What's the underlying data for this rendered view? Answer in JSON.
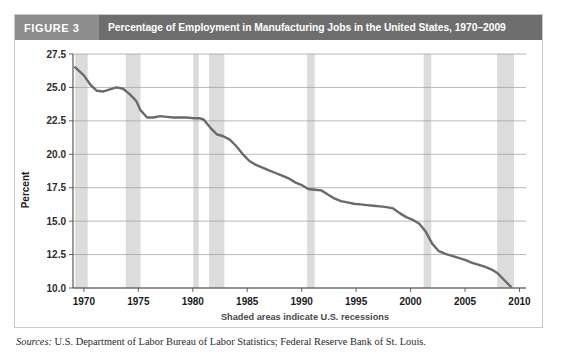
{
  "figure": {
    "tag": "FIGURE 3",
    "title": "Percentage of Employment in Manufacturing Jobs in the United States, 1970–2009",
    "tag_bg": "#8d8d8d",
    "title_bg": "#6e6e6e",
    "panel_border": "#c9c9c9"
  },
  "source": {
    "label": "Sources:",
    "text": " U.S. Department of Labor Bureau of Labor Statistics; Federal Reserve Bank of St. Louis."
  },
  "chart_data": {
    "type": "line",
    "title": "Percentage of Employment in Manufacturing Jobs in the United States, 1970–2009",
    "xlabel": "",
    "ylabel": "Percent",
    "caption": "Shaded areas indicate U.S. recessions",
    "xlim": [
      1969.0,
      2010.6
    ],
    "ylim": [
      10.0,
      27.5
    ],
    "xticks": [
      1970,
      1975,
      1980,
      1985,
      1990,
      1995,
      2000,
      2005,
      2010
    ],
    "xtick_labels": [
      "1970",
      "1975",
      "1980",
      "1985",
      "1990",
      "1995",
      "2000",
      "2005",
      "2010"
    ],
    "yticks": [
      10.0,
      12.5,
      15.0,
      17.5,
      20.0,
      22.5,
      25.0,
      27.5
    ],
    "ytick_labels": [
      "10.0",
      "12.5",
      "15.0",
      "17.5",
      "20.0",
      "22.5",
      "25.0",
      "27.5"
    ],
    "grid": "horizontal",
    "grid_color": "#9a9a9a",
    "line_color": "#6a6a6a",
    "line_width": 2.4,
    "band_color": "#dcdcdc",
    "legend": "none",
    "series": [
      {
        "name": "Manufacturing share of employment",
        "x": [
          1969.2,
          1970.0,
          1970.6,
          1971.2,
          1971.8,
          1972.4,
          1973.0,
          1973.6,
          1974.2,
          1974.8,
          1975.2,
          1975.8,
          1976.4,
          1977.0,
          1977.6,
          1978.2,
          1978.8,
          1979.4,
          1980.0,
          1980.6,
          1981.0,
          1981.6,
          1982.2,
          1982.8,
          1983.4,
          1984.0,
          1984.6,
          1985.2,
          1985.8,
          1986.4,
          1987.0,
          1987.6,
          1988.2,
          1988.8,
          1989.4,
          1990.0,
          1990.6,
          1991.2,
          1991.8,
          1992.4,
          1993.0,
          1993.6,
          1994.2,
          1994.8,
          1995.4,
          1996.0,
          1996.6,
          1997.2,
          1997.8,
          1998.4,
          1999.0,
          1999.6,
          2000.2,
          2000.8,
          2001.4,
          2002.0,
          2002.6,
          2003.2,
          2003.8,
          2004.4,
          2005.0,
          2005.6,
          2006.2,
          2006.8,
          2007.4,
          2008.0,
          2008.6,
          2009.2
        ],
        "y": [
          26.5,
          25.9,
          25.2,
          24.75,
          24.7,
          24.85,
          25.0,
          24.9,
          24.5,
          24.0,
          23.3,
          22.75,
          22.75,
          22.85,
          22.8,
          22.75,
          22.75,
          22.75,
          22.7,
          22.7,
          22.6,
          22.0,
          21.5,
          21.35,
          21.1,
          20.6,
          20.0,
          19.5,
          19.2,
          19.0,
          18.8,
          18.6,
          18.4,
          18.2,
          17.9,
          17.7,
          17.4,
          17.35,
          17.3,
          17.0,
          16.7,
          16.5,
          16.4,
          16.3,
          16.25,
          16.2,
          16.15,
          16.1,
          16.05,
          15.95,
          15.6,
          15.3,
          15.1,
          14.8,
          14.2,
          13.3,
          12.75,
          12.55,
          12.4,
          12.25,
          12.1,
          11.9,
          11.75,
          11.6,
          11.4,
          11.1,
          10.6,
          10.1
        ]
      }
    ],
    "recession_bands": [
      {
        "start": 1969.2,
        "end": 1970.35,
        "label": "1969-1970 recession"
      },
      {
        "start": 1973.85,
        "end": 1975.2,
        "label": "1973-1975 recession"
      },
      {
        "start": 1980.05,
        "end": 1980.55,
        "label": "1980 recession"
      },
      {
        "start": 1981.5,
        "end": 1982.9,
        "label": "1981-1982 recession"
      },
      {
        "start": 1990.5,
        "end": 1991.2,
        "label": "1990-1991 recession"
      },
      {
        "start": 2001.2,
        "end": 2001.9,
        "label": "2001 recession"
      },
      {
        "start": 2007.95,
        "end": 2009.5,
        "label": "2007-2009 recession"
      }
    ]
  }
}
